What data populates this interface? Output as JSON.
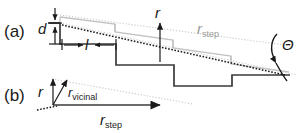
{
  "figure": {
    "type": "scientific-schematic",
    "background_color": "#ffffff",
    "colors": {
      "dark_step": "#3a3a3a",
      "light_step": "#c2c2c2",
      "dotted_gray": "#cccccc",
      "dotted_black": "#1a1a1a",
      "text": "#1a1a1a",
      "gray_text": "#9a9a9a"
    }
  },
  "panel_a": {
    "label": "(a)",
    "labels": {
      "step_height": "d",
      "terrace_width": "l",
      "growth_rate": "r",
      "step_rate_main": "r",
      "step_rate_sub": "step",
      "miscut_angle": "Θ"
    },
    "annotations": {
      "d_meaning": "step height, vertical double-headed arrow at left riser",
      "l_meaning": "terrace width, horizontal double-headed arrow on first terrace",
      "r_meaning": "normal growth rate vector, vertical arrow from terrace",
      "r_step_meaning": "step flow rate, gray label along gray dotted envelope",
      "theta_meaning": "miscut angle between stepped surface and singular plane"
    },
    "staircase": {
      "num_steps": 4,
      "direction": "descending-left-to-right"
    }
  },
  "panel_b": {
    "label": "(b)",
    "labels": {
      "growth_rate": "r",
      "vicinal_main": "r",
      "vicinal_sub": "vicinal",
      "step_main": "r",
      "step_sub": "step"
    },
    "annotations": {
      "r_meaning": "vertical growth-rate vector",
      "r_vicinal_meaning": "resultant vicinal-surface growth vector, tilted arrow",
      "r_step_meaning": "horizontal step-flow rate vector"
    },
    "vectors": [
      {
        "name": "r",
        "direction": "vertical-up"
      },
      {
        "name": "r_vicinal",
        "direction": "up-and-right-tilted"
      },
      {
        "name": "r_step",
        "direction": "horizontal-right"
      }
    ]
  }
}
